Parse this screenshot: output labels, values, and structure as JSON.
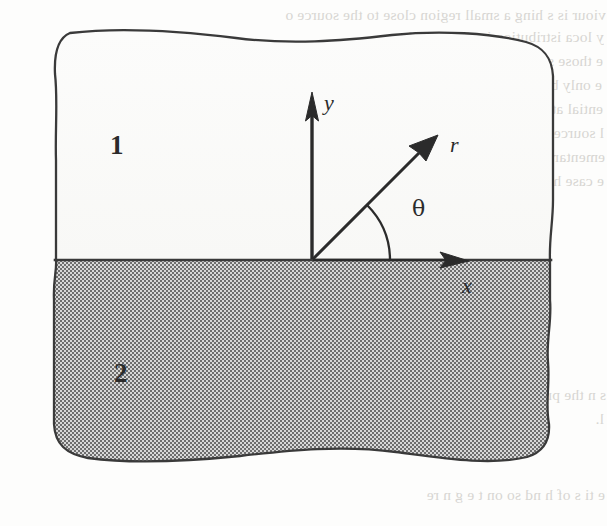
{
  "figure": {
    "kind": "scanned-book-diagram",
    "page_background": "#fdfdfc",
    "ink_color": "#2b2b2b",
    "outline_color": "#3a3a3a",
    "region_fill_shaded": "#9a9a9a",
    "region_fill_clear": "#fbfbfa",
    "bleed_through_color": "#b9b6b1"
  },
  "regions": [
    {
      "id": "region-upper",
      "label": "1",
      "shading": "unshaded",
      "label_x": 110,
      "label_y": 132
    },
    {
      "id": "region-lower",
      "label": "2",
      "shading": "gray-halftone",
      "label_x": 114,
      "label_y": 360
    }
  ],
  "interface": {
    "name": "region-boundary-line",
    "y": 260,
    "x_start": 55,
    "x_end": 551,
    "style": "straight-horizontal"
  },
  "coordinate_system": {
    "origin": {
      "x": 312,
      "y": 260
    },
    "axes": [
      {
        "id": "y-axis",
        "label": "y",
        "direction": "up",
        "tip_x": 312,
        "tip_y": 95,
        "label_x": 324,
        "label_y": 92
      },
      {
        "id": "x-axis",
        "label": "x",
        "direction": "right",
        "tip_x": 467,
        "tip_y": 260,
        "label_x": 462,
        "label_y": 275
      }
    ],
    "vector": {
      "id": "r-vector",
      "label": "r",
      "tip_x": 437,
      "tip_y": 136,
      "label_x": 450,
      "label_y": 134,
      "angle_degrees": 45
    },
    "angle": {
      "id": "theta-angle",
      "label": "θ",
      "arc_radius": 78,
      "label_x": 412,
      "label_y": 198
    }
  },
  "bleed_through_lines": [
    {
      "text": "viour is s hing a small region close to the source o",
      "x": 6,
      "y": 6,
      "size": 15.5
    },
    {
      "text": "y loca   istribution issdistinguish   me",
      "x": 4,
      "y": 28,
      "size": 15.5
    },
    {
      "text": "e those similarly and resilient. It is a pr",
      "x": 3,
      "y": 52,
      "size": 15.5
    },
    {
      "text": "e only before  of  tions is t gral behind",
      "x": 2,
      "y": 76,
      "size": 15.5
    },
    {
      "text": "ential at a v ry  ample delta  r a uniform p",
      "x": 3,
      "y": 100,
      "size": 15.5
    },
    {
      "text": "l source  involve the cross sect  y, for the",
      "x": 4,
      "y": 124,
      "size": 15.5
    },
    {
      "text": "ementary  ce. If  th  is  antities  ich  r",
      "x": 5,
      "y": 148,
      "size": 15.5
    },
    {
      "text": "e case  ha  one is to find how ar an  ese",
      "x": 4,
      "y": 172,
      "size": 15.5
    },
    {
      "text": "s   n   the pr blem  i  ot  l      n  t   a",
      "x": 6,
      "y": 386,
      "size": 15.5
    },
    {
      "text": "l.",
      "x": 4,
      "y": 410,
      "size": 15.5
    },
    {
      "text": "e   ti   s of  h   nd  so  on  t e  g  n   re",
      "x": 5,
      "y": 486,
      "size": 15.5
    }
  ]
}
